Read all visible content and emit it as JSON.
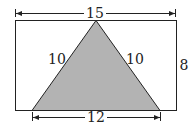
{
  "diagram": {
    "rectangle": {
      "width_label": "15",
      "height_label": "8"
    },
    "triangle": {
      "left_side_label": "10",
      "right_side_label": "10",
      "base_label": "12",
      "fill": "#b3b3b3"
    },
    "colors": {
      "stroke": "#222222",
      "background": "#ffffff",
      "triangle_fill": "#b3b3b3"
    }
  }
}
